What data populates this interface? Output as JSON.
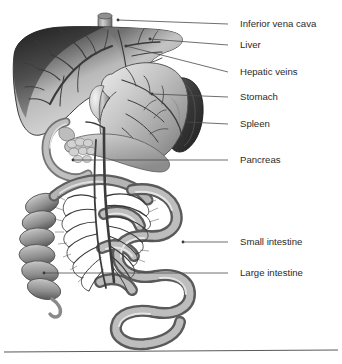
{
  "figure": {
    "style": "grayscale medical illustration",
    "background_color": "#ffffff",
    "width": 342,
    "height": 364,
    "label_text_color": "#2b2b2b",
    "leader_line_color": "#4a4a4a",
    "base_rule_color": "#5a5a5a"
  },
  "labels": [
    {
      "id": "inferior-vena-cava",
      "text": "Inferior vena cava",
      "text_x": 240,
      "text_y": 24,
      "leader": {
        "x1": 228,
        "y1": 24,
        "x2": 118,
        "y2": 20
      },
      "dot": {
        "x": 118,
        "y": 20
      }
    },
    {
      "id": "liver",
      "text": "Liver",
      "text_x": 240,
      "text_y": 45,
      "leader": {
        "x1": 228,
        "y1": 45,
        "x2": 150,
        "y2": 39
      },
      "dot": {
        "x": 150,
        "y": 39
      }
    },
    {
      "id": "hepatic-veins",
      "text": "Hepatic veins",
      "text_x": 240,
      "text_y": 72,
      "leader": {
        "x1": 228,
        "y1": 72,
        "x2": 126,
        "y2": 46
      },
      "dot": {
        "x": 126,
        "y": 46
      }
    },
    {
      "id": "stomach",
      "text": "Stomach",
      "text_x": 240,
      "text_y": 97,
      "leader": {
        "x1": 228,
        "y1": 97,
        "x2": 152,
        "y2": 94
      },
      "dot": {
        "x": 152,
        "y": 94
      }
    },
    {
      "id": "spleen",
      "text": "Spleen",
      "text_x": 240,
      "text_y": 124,
      "leader": {
        "x1": 228,
        "y1": 124,
        "x2": 187,
        "y2": 122
      },
      "dot": {
        "x": 187,
        "y": 122
      }
    },
    {
      "id": "pancreas",
      "text": "Pancreas",
      "text_x": 240,
      "text_y": 160,
      "leader": {
        "x1": 228,
        "y1": 160,
        "x2": 73,
        "y2": 160
      },
      "dot": {
        "x": 73,
        "y": 160
      }
    },
    {
      "id": "small-intestine",
      "text": "Small intestine",
      "text_x": 240,
      "text_y": 242,
      "leader": {
        "x1": 228,
        "y1": 242,
        "x2": 183,
        "y2": 242
      },
      "dot": {
        "x": 183,
        "y": 242
      }
    },
    {
      "id": "large-intestine",
      "text": "Large intestine",
      "text_x": 240,
      "text_y": 273,
      "leader": {
        "x1": 228,
        "y1": 273,
        "x2": 44,
        "y2": 273
      },
      "dot": {
        "x": 44,
        "y": 273
      }
    }
  ],
  "base_rule": {
    "x1": 4,
    "y1": 352,
    "x2": 338,
    "y2": 350
  },
  "organs": [
    {
      "id": "liver",
      "name": "Liver",
      "description": "large lobed organ upper left, dark superior border with lighter parenchyma and branching hepatic vessels"
    },
    {
      "id": "inferior-vena-cava",
      "name": "Inferior vena cava",
      "description": "vertical cylindrical vessel ascending at top center behind the liver"
    },
    {
      "id": "stomach",
      "name": "Stomach",
      "description": "curved J-shaped sac center right of the liver, mid-gray with greater curvature vessels"
    },
    {
      "id": "spleen",
      "name": "Spleen",
      "description": "dark elongated oval organ at far right lateral to the stomach, darkest tone in image"
    },
    {
      "id": "pancreas",
      "name": "Pancreas",
      "description": "lobulated elongated gland below the stomach extending left to the duodenal loop"
    },
    {
      "id": "duodenum",
      "name": "Duodenum",
      "description": "C-shaped loop of bowel curving around the pancreatic head on the left"
    },
    {
      "id": "small-intestine",
      "name": "Small intestine",
      "description": "coiled loops of jejunum and ileum filling the lower right of the abdomen"
    },
    {
      "id": "large-intestine",
      "name": "Large intestine",
      "description": "segmented haustrated colon on the left forming the ascending colon"
    },
    {
      "id": "mesenteric-vessels",
      "name": "Mesenteric vessels",
      "description": "dense radiating arterial arcade fanning from the central root of mesentery"
    }
  ]
}
